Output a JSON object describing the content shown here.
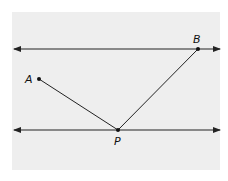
{
  "diagram": {
    "background_color": "#ffffff",
    "panel_color": "#eeeeee",
    "line_color": "#222222",
    "panel": {
      "x": 12,
      "y": 12,
      "width": 208,
      "height": 158
    },
    "parallel_lines": [
      {
        "name": "top-line",
        "y": 49,
        "x1": 14,
        "x2": 220
      },
      {
        "name": "bottom-line",
        "y": 130,
        "x1": 14,
        "x2": 220
      }
    ],
    "points": {
      "A": {
        "label": "A",
        "x": 39,
        "y": 79,
        "label_x": 25,
        "label_y": 83
      },
      "B": {
        "label": "B",
        "x": 198,
        "y": 49,
        "label_x": 193,
        "label_y": 43
      },
      "P": {
        "label": "P",
        "x": 118,
        "y": 130,
        "label_x": 114,
        "label_y": 145
      }
    },
    "segments": [
      {
        "from": "A",
        "to": "P"
      },
      {
        "from": "P",
        "to": "B"
      }
    ]
  }
}
